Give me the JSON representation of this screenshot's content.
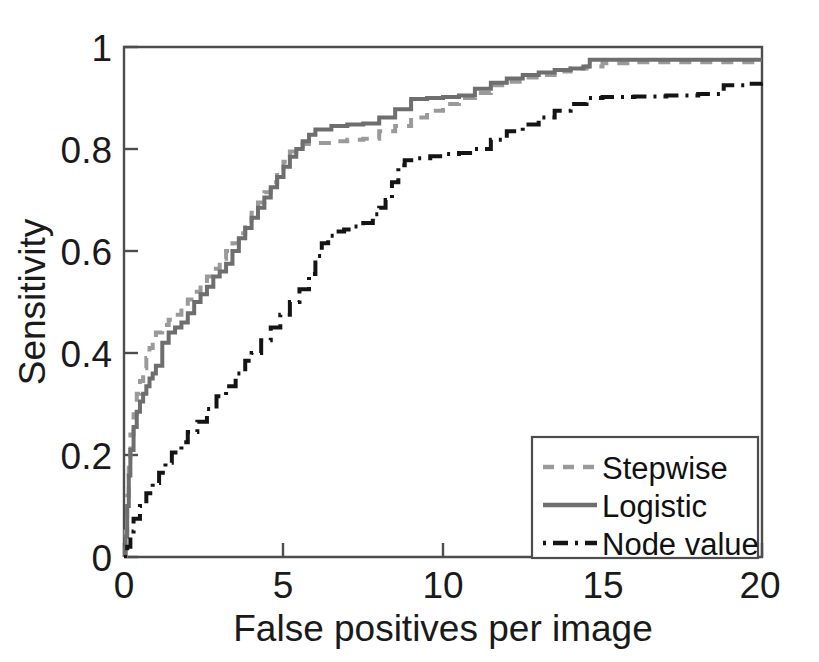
{
  "figure": {
    "background_color": "#ffffff",
    "type": "froc-curve-figure"
  },
  "chart_data": {
    "type": "line",
    "title": "",
    "subtitle": "",
    "xlabel": "False positives per image",
    "ylabel": "Sensitivity",
    "xlim": [
      0,
      20
    ],
    "ylim": [
      0,
      1
    ],
    "xticks": [
      0,
      5,
      10,
      15,
      20
    ],
    "xticklabels": [
      "0",
      "5",
      "10",
      "15",
      "20"
    ],
    "yticks": [
      0,
      0.2,
      0.4,
      0.6,
      0.8,
      1
    ],
    "yticklabels": [
      "0",
      "0.2",
      "0.4",
      "0.6",
      "0.8",
      "1"
    ],
    "grid": false,
    "legend_position": "lower right",
    "series": [
      {
        "name": "Stepwise",
        "color": "#9a9a9a",
        "linestyle": "dashed",
        "linewidth": 4,
        "points": [
          [
            0.0,
            0.0
          ],
          [
            0.05,
            0.05
          ],
          [
            0.1,
            0.12
          ],
          [
            0.15,
            0.19
          ],
          [
            0.2,
            0.24
          ],
          [
            0.3,
            0.28
          ],
          [
            0.4,
            0.32
          ],
          [
            0.5,
            0.345
          ],
          [
            0.6,
            0.37
          ],
          [
            0.7,
            0.39
          ],
          [
            0.8,
            0.41
          ],
          [
            0.9,
            0.425
          ],
          [
            1.0,
            0.44
          ],
          [
            1.2,
            0.455
          ],
          [
            1.4,
            0.465
          ],
          [
            1.6,
            0.475
          ],
          [
            1.8,
            0.49
          ],
          [
            2.0,
            0.505
          ],
          [
            2.2,
            0.52
          ],
          [
            2.4,
            0.535
          ],
          [
            2.6,
            0.55
          ],
          [
            2.8,
            0.565
          ],
          [
            3.0,
            0.585
          ],
          [
            3.2,
            0.6
          ],
          [
            3.4,
            0.615
          ],
          [
            3.6,
            0.635
          ],
          [
            3.8,
            0.655
          ],
          [
            4.0,
            0.675
          ],
          [
            4.2,
            0.695
          ],
          [
            4.4,
            0.715
          ],
          [
            4.6,
            0.735
          ],
          [
            4.8,
            0.755
          ],
          [
            5.0,
            0.775
          ],
          [
            5.2,
            0.795
          ],
          [
            5.4,
            0.805
          ],
          [
            5.6,
            0.81
          ],
          [
            6.0,
            0.812
          ],
          [
            6.5,
            0.815
          ],
          [
            7.0,
            0.818
          ],
          [
            7.5,
            0.82
          ],
          [
            8.0,
            0.835
          ],
          [
            8.5,
            0.845
          ],
          [
            9.0,
            0.862
          ],
          [
            9.5,
            0.875
          ],
          [
            10.0,
            0.888
          ],
          [
            10.5,
            0.9
          ],
          [
            11.0,
            0.91
          ],
          [
            11.5,
            0.925
          ],
          [
            12.0,
            0.932
          ],
          [
            12.5,
            0.94
          ],
          [
            13.0,
            0.945
          ],
          [
            13.5,
            0.952
          ],
          [
            14.0,
            0.958
          ],
          [
            14.5,
            0.962
          ],
          [
            15.0,
            0.968
          ],
          [
            16.0,
            0.97
          ],
          [
            18.0,
            0.97
          ],
          [
            20.0,
            0.97
          ]
        ]
      },
      {
        "name": "Logistic",
        "color": "#6e6e6e",
        "linestyle": "solid",
        "linewidth": 4,
        "points": [
          [
            0.0,
            0.0
          ],
          [
            0.05,
            0.04
          ],
          [
            0.1,
            0.1
          ],
          [
            0.15,
            0.16
          ],
          [
            0.2,
            0.21
          ],
          [
            0.3,
            0.255
          ],
          [
            0.4,
            0.285
          ],
          [
            0.5,
            0.305
          ],
          [
            0.6,
            0.32
          ],
          [
            0.7,
            0.335
          ],
          [
            0.8,
            0.35
          ],
          [
            0.9,
            0.36
          ],
          [
            1.0,
            0.375
          ],
          [
            1.2,
            0.42
          ],
          [
            1.4,
            0.44
          ],
          [
            1.6,
            0.45
          ],
          [
            1.8,
            0.46
          ],
          [
            2.0,
            0.478
          ],
          [
            2.2,
            0.5
          ],
          [
            2.4,
            0.515
          ],
          [
            2.6,
            0.53
          ],
          [
            2.8,
            0.55
          ],
          [
            3.0,
            0.56
          ],
          [
            3.2,
            0.575
          ],
          [
            3.4,
            0.6
          ],
          [
            3.6,
            0.625
          ],
          [
            3.8,
            0.645
          ],
          [
            4.0,
            0.665
          ],
          [
            4.2,
            0.685
          ],
          [
            4.4,
            0.705
          ],
          [
            4.6,
            0.725
          ],
          [
            4.8,
            0.745
          ],
          [
            5.0,
            0.765
          ],
          [
            5.2,
            0.785
          ],
          [
            5.4,
            0.8
          ],
          [
            5.6,
            0.815
          ],
          [
            5.8,
            0.828
          ],
          [
            6.0,
            0.838
          ],
          [
            6.5,
            0.845
          ],
          [
            7.0,
            0.848
          ],
          [
            7.5,
            0.85
          ],
          [
            8.0,
            0.862
          ],
          [
            8.5,
            0.878
          ],
          [
            9.0,
            0.898
          ],
          [
            9.5,
            0.9
          ],
          [
            10.0,
            0.902
          ],
          [
            10.5,
            0.905
          ],
          [
            11.0,
            0.918
          ],
          [
            11.5,
            0.93
          ],
          [
            12.0,
            0.938
          ],
          [
            12.5,
            0.945
          ],
          [
            13.0,
            0.95
          ],
          [
            13.5,
            0.955
          ],
          [
            14.0,
            0.958
          ],
          [
            14.4,
            0.962
          ],
          [
            14.6,
            0.975
          ],
          [
            15.0,
            0.975
          ],
          [
            16.0,
            0.975
          ],
          [
            18.0,
            0.975
          ],
          [
            20.0,
            0.975
          ]
        ]
      },
      {
        "name": "Node value",
        "color": "#141414",
        "linestyle": "dashdot",
        "linewidth": 4,
        "points": [
          [
            0.0,
            0.0
          ],
          [
            0.1,
            0.02
          ],
          [
            0.2,
            0.05
          ],
          [
            0.3,
            0.075
          ],
          [
            0.5,
            0.1
          ],
          [
            0.7,
            0.125
          ],
          [
            0.9,
            0.145
          ],
          [
            1.1,
            0.165
          ],
          [
            1.3,
            0.185
          ],
          [
            1.5,
            0.205
          ],
          [
            1.8,
            0.225
          ],
          [
            2.0,
            0.245
          ],
          [
            2.3,
            0.265
          ],
          [
            2.6,
            0.29
          ],
          [
            2.9,
            0.315
          ],
          [
            3.2,
            0.335
          ],
          [
            3.5,
            0.36
          ],
          [
            3.8,
            0.385
          ],
          [
            4.0,
            0.4
          ],
          [
            4.3,
            0.425
          ],
          [
            4.6,
            0.45
          ],
          [
            4.9,
            0.475
          ],
          [
            5.2,
            0.5
          ],
          [
            5.5,
            0.525
          ],
          [
            5.8,
            0.555
          ],
          [
            6.0,
            0.59
          ],
          [
            6.2,
            0.615
          ],
          [
            6.4,
            0.63
          ],
          [
            6.6,
            0.638
          ],
          [
            6.9,
            0.642
          ],
          [
            7.2,
            0.648
          ],
          [
            7.5,
            0.655
          ],
          [
            7.8,
            0.672
          ],
          [
            8.0,
            0.685
          ],
          [
            8.2,
            0.7
          ],
          [
            8.4,
            0.735
          ],
          [
            8.6,
            0.768
          ],
          [
            8.8,
            0.778
          ],
          [
            9.2,
            0.782
          ],
          [
            9.6,
            0.786
          ],
          [
            10.0,
            0.79
          ],
          [
            10.5,
            0.792
          ],
          [
            11.0,
            0.8
          ],
          [
            11.5,
            0.818
          ],
          [
            12.0,
            0.835
          ],
          [
            12.5,
            0.848
          ],
          [
            13.0,
            0.862
          ],
          [
            13.5,
            0.875
          ],
          [
            14.0,
            0.888
          ],
          [
            14.5,
            0.9
          ],
          [
            15.0,
            0.902
          ],
          [
            16.0,
            0.903
          ],
          [
            17.0,
            0.905
          ],
          [
            18.0,
            0.908
          ],
          [
            18.8,
            0.925
          ],
          [
            19.5,
            0.928
          ],
          [
            20.0,
            0.93
          ]
        ]
      }
    ]
  },
  "axes": {
    "x_axis_label": "False positives per image",
    "y_axis_label": "Sensitivity",
    "x_tick_labels": [
      "0",
      "5",
      "10",
      "15",
      "20"
    ],
    "y_tick_labels": [
      "0",
      "0.2",
      "0.4",
      "0.6",
      "0.8",
      "1"
    ]
  },
  "legend": {
    "entries": [
      {
        "label": "Stepwise",
        "color": "#9a9a9a",
        "style": "dashed"
      },
      {
        "label": "Logistic",
        "color": "#6e6e6e",
        "style": "solid"
      },
      {
        "label": "Node value",
        "color": "#141414",
        "style": "dashdot"
      }
    ]
  }
}
